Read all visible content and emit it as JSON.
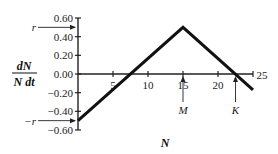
{
  "chart_data": {
    "type": "line",
    "title": "",
    "xlabel": "N",
    "ylabel_num": "dN",
    "ylabel_den": "N dt",
    "xlim": [
      0,
      25
    ],
    "ylim": [
      -0.6,
      0.6
    ],
    "x_ticks": [
      5,
      10,
      15,
      20,
      25
    ],
    "x_tick_labels": [
      "5",
      "10",
      "15",
      "20",
      "25"
    ],
    "y_ticks": [
      0.6,
      0.4,
      0.2,
      0.0,
      -0.2,
      -0.4,
      -0.6
    ],
    "y_tick_labels": [
      "0.60",
      "0.40",
      "0.20",
      "0.00",
      "−0.20",
      "−0.40",
      "−0.60"
    ],
    "grid": false,
    "series": [
      {
        "name": "per capita growth rate",
        "x": [
          0,
          15,
          25
        ],
        "y": [
          -0.5,
          0.5,
          -0.17
        ]
      }
    ],
    "annotations": [
      {
        "label": "r",
        "axis": "y",
        "value": 0.5,
        "type": "arrow-left"
      },
      {
        "label": "−r",
        "axis": "y",
        "value": -0.5,
        "type": "arrow-left"
      },
      {
        "label": "M",
        "axis": "x",
        "value": 15,
        "type": "arrow-up"
      },
      {
        "label": "K",
        "axis": "x",
        "value": 22.5,
        "type": "arrow-up"
      }
    ]
  }
}
